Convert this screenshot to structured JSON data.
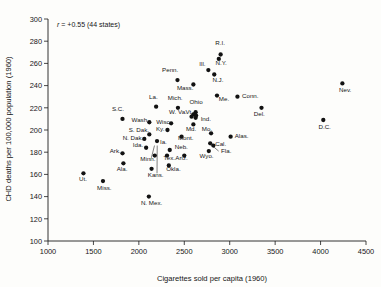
{
  "chart_data": {
    "type": "scatter",
    "title": "",
    "xlabel": "Cigarettes sold per capita (1960)",
    "ylabel": "CHD deaths per 100,000 population (1960)",
    "xlim": [
      1000,
      4500
    ],
    "ylim": [
      100,
      300
    ],
    "xticks": [
      1000,
      1500,
      2000,
      2500,
      3000,
      3500,
      4000,
      4500
    ],
    "yticks": [
      100,
      120,
      140,
      160,
      180,
      200,
      220,
      240,
      260,
      280,
      300
    ],
    "grid": false,
    "legend": "none",
    "annotation": "r = +0.55 (44 states)",
    "annotation_parts": {
      "symbol": "r",
      "rest": " = +0.55 (44 states)"
    },
    "marker_color": "#121212",
    "axis_color": "#1b1b1b",
    "n_points": 44,
    "points": [
      {
        "label": "R.I.",
        "x": 2900,
        "y": 268,
        "lx": 2895,
        "ly": 277,
        "anchor": "middle"
      },
      {
        "label": "N.Y.",
        "x": 2880,
        "y": 264,
        "lx": 2905,
        "ly": 259,
        "anchor": "middle"
      },
      {
        "label": "Ill.",
        "x": 2765,
        "y": 254,
        "lx": 2700,
        "ly": 258,
        "anchor": "middle"
      },
      {
        "label": "N.J.",
        "x": 2830,
        "y": 250,
        "lx": 2870,
        "ly": 243,
        "anchor": "middle"
      },
      {
        "label": "Penn.",
        "x": 2425,
        "y": 245,
        "lx": 2345,
        "ly": 252,
        "anchor": "middle"
      },
      {
        "label": "Nev.",
        "x": 4240,
        "y": 242,
        "lx": 4270,
        "ly": 234,
        "anchor": "middle"
      },
      {
        "label": "Mass.",
        "x": 2600,
        "y": 241,
        "lx": 2510,
        "ly": 236,
        "anchor": "middle"
      },
      {
        "label": "Me.",
        "x": 2860,
        "y": 231,
        "lx": 2880,
        "ly": 226,
        "anchor": "start"
      },
      {
        "label": "Conn.",
        "x": 3085,
        "y": 230,
        "lx": 3135,
        "ly": 229,
        "anchor": "start"
      },
      {
        "label": "La.",
        "x": 2190,
        "y": 221,
        "lx": 2160,
        "ly": 228,
        "anchor": "middle"
      },
      {
        "label": "Mich.",
        "x": 2430,
        "y": 220,
        "lx": 2400,
        "ly": 227,
        "anchor": "middle"
      },
      {
        "label": "Del.",
        "x": 3350,
        "y": 220,
        "lx": 3325,
        "ly": 213,
        "anchor": "middle"
      },
      {
        "label": "Ohio",
        "x": 2625,
        "y": 216,
        "lx": 2630,
        "ly": 223,
        "anchor": "middle"
      },
      {
        "label": "Vt.",
        "x": 2600,
        "y": 214,
        "lx": 2555,
        "ly": 214,
        "anchor": "middle"
      },
      {
        "label": "W. Va.",
        "x": 2580,
        "y": 212,
        "lx": 2430,
        "ly": 214,
        "anchor": "middle"
      },
      {
        "label": "Ind.",
        "x": 2625,
        "y": 211,
        "lx": 2680,
        "ly": 208,
        "anchor": "start"
      },
      {
        "label": "S.C.",
        "x": 1820,
        "y": 210,
        "lx": 1770,
        "ly": 217,
        "anchor": "middle"
      },
      {
        "label": "D.C.",
        "x": 4030,
        "y": 209,
        "lx": 4045,
        "ly": 201,
        "anchor": "middle"
      },
      {
        "label": "Wash.",
        "x": 2115,
        "y": 207,
        "lx": 2015,
        "ly": 207,
        "anchor": "middle"
      },
      {
        "label": "Wisc.",
        "x": 2355,
        "y": 206,
        "lx": 2275,
        "ly": 205,
        "anchor": "middle"
      },
      {
        "label": "Md.",
        "x": 2600,
        "y": 205,
        "lx": 2575,
        "ly": 199,
        "anchor": "middle"
      },
      {
        "label": "Ky.",
        "x": 2315,
        "y": 200,
        "lx": 2235,
        "ly": 199,
        "anchor": "middle"
      },
      {
        "label": "Mo.",
        "x": 2795,
        "y": 197,
        "lx": 2750,
        "ly": 199,
        "anchor": "middle"
      },
      {
        "label": "S. Dak.",
        "x": 2115,
        "y": 196,
        "lx": 2000,
        "ly": 198,
        "anchor": "middle"
      },
      {
        "label": "Mont.",
        "x": 2470,
        "y": 194,
        "lx": 2430,
        "ly": 191,
        "anchor": "start"
      },
      {
        "label": "Alas.",
        "x": 3010,
        "y": 194,
        "lx": 3055,
        "ly": 193,
        "anchor": "start"
      },
      {
        "label": "N. Dak.",
        "x": 2060,
        "y": 192,
        "lx": 1935,
        "ly": 191,
        "anchor": "middle"
      },
      {
        "label": "Ia.",
        "x": 2200,
        "y": 190,
        "lx": 2270,
        "ly": 187,
        "anchor": "middle"
      },
      {
        "label": "Cal.",
        "x": 2785,
        "y": 188,
        "lx": 2840,
        "ly": 186,
        "anchor": "start"
      },
      {
        "label": "Ida.",
        "x": 2080,
        "y": 184,
        "lx": 1990,
        "ly": 185,
        "anchor": "middle"
      },
      {
        "label": "Fla.",
        "x": 2820,
        "y": 186,
        "lx": 2905,
        "ly": 179,
        "anchor": "start",
        "leader": {
          "x1": 2878,
          "y1": 181,
          "x2": 2806,
          "y2": 186
        }
      },
      {
        "label": "Neb.",
        "x": 2340,
        "y": 182,
        "lx": 2395,
        "ly": 183,
        "anchor": "start"
      },
      {
        "label": "Wyo.",
        "x": 2770,
        "y": 181,
        "lx": 2745,
        "ly": 175,
        "anchor": "middle"
      },
      {
        "label": "Ark.",
        "x": 1820,
        "y": 179,
        "lx": 1740,
        "ly": 179,
        "anchor": "middle"
      },
      {
        "label": "Minn.",
        "x": 2175,
        "y": 177,
        "lx": 2100,
        "ly": 172,
        "anchor": "middle",
        "leader": {
          "x1": 2138,
          "y1": 175,
          "x2": 2172,
          "y2": 186
        }
      },
      {
        "label": "Tex.",
        "x": 2310,
        "y": 177,
        "lx": 2335,
        "ly": 173,
        "anchor": "middle"
      },
      {
        "label": "Ariz.",
        "x": 2500,
        "y": 177,
        "lx": 2470,
        "ly": 173,
        "anchor": "middle"
      },
      {
        "label": "Ala.",
        "x": 1830,
        "y": 170,
        "lx": 1815,
        "ly": 163,
        "anchor": "middle"
      },
      {
        "label": "Okla.",
        "x": 2330,
        "y": 168,
        "lx": 2380,
        "ly": 163,
        "anchor": "middle"
      },
      {
        "label": "Kans.",
        "x": 2140,
        "y": 165,
        "lx": 2185,
        "ly": 158,
        "anchor": "middle",
        "leader": {
          "x1": 2200,
          "y1": 161,
          "x2": 2202,
          "y2": 186
        }
      },
      {
        "label": "Ut.",
        "x": 1390,
        "y": 161,
        "lx": 1385,
        "ly": 154,
        "anchor": "middle"
      },
      {
        "label": "Miss.",
        "x": 1605,
        "y": 154,
        "lx": 1620,
        "ly": 146,
        "anchor": "middle"
      },
      {
        "label": "N. Mex.",
        "x": 2110,
        "y": 140,
        "lx": 2140,
        "ly": 132,
        "anchor": "middle"
      },
      {
        "label": "N.H.",
        "x": 2630,
        "y": 213,
        "lx": 2630,
        "ly": 213,
        "anchor": "middle",
        "hide_label": true
      }
    ]
  }
}
